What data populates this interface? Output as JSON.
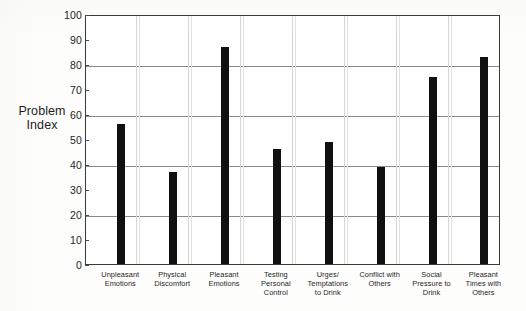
{
  "chart_data": {
    "type": "bar",
    "title": "",
    "xlabel": "",
    "ylabel": "Problem Index",
    "ylabel_lines": [
      "Problem",
      "Index"
    ],
    "ylim": [
      0,
      100
    ],
    "yticks": [
      0,
      10,
      20,
      30,
      40,
      50,
      60,
      70,
      80,
      90,
      100
    ],
    "ytick_labels": [
      "0",
      "10",
      "20",
      "30",
      "40",
      "50",
      "60",
      "70",
      "80",
      "90",
      "100"
    ],
    "gridlines_y": [
      20,
      40,
      60,
      80
    ],
    "grid": true,
    "legend": "none",
    "categories": [
      "Unpleasant Emotions",
      "Physical Discomfort",
      "Pleasant Emotions",
      "Testing Personal Control",
      "Urges/Temptations to Drink",
      "Conflict with Others",
      "Social Pressure to Drink",
      "Pleasant Times with Others"
    ],
    "category_lines": [
      [
        "Unpleasant",
        "Emotions"
      ],
      [
        "Physical",
        "Discomfort"
      ],
      [
        "Pleasant",
        "Emotions"
      ],
      [
        "Testing",
        "Personal",
        "Control"
      ],
      [
        "Urges/",
        "Temptations",
        "to Drink"
      ],
      [
        "Conflict with",
        "Others"
      ],
      [
        "Social",
        "Pressure to",
        "Drink"
      ],
      [
        "Pleasant",
        "Times with",
        "Others"
      ]
    ],
    "values": [
      56,
      37,
      87,
      46,
      49,
      39,
      75,
      83
    ],
    "bar_color": "#101010"
  }
}
